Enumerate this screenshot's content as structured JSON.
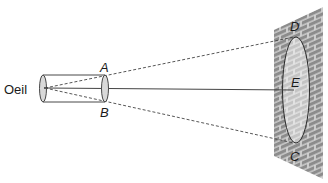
{
  "diagram": {
    "type": "optics-field-of-view",
    "labels": {
      "eye": "Oeil",
      "A": "A",
      "B": "B",
      "C": "C",
      "D": "D",
      "E": "E"
    },
    "elements": {
      "tube": "cylinder (viewing tube) from eye to opening AB",
      "wall": "brick wall",
      "visible_zone": "ellipse DC seen on the wall, center E",
      "rays": [
        {
          "from": "Oeil",
          "through": "A",
          "to": "D",
          "style": "dashed"
        },
        {
          "from": "Oeil",
          "through": "B",
          "to": "C",
          "style": "dashed"
        },
        {
          "from": "Oeil",
          "to": "E",
          "style": "solid"
        }
      ]
    },
    "colors": {
      "line": "#333333",
      "brick": "#8c8c8c",
      "mortar": "#d6d6d6",
      "zone_fill": "#c9c9c9",
      "tube_end_fill": "#d9d9d9"
    }
  }
}
